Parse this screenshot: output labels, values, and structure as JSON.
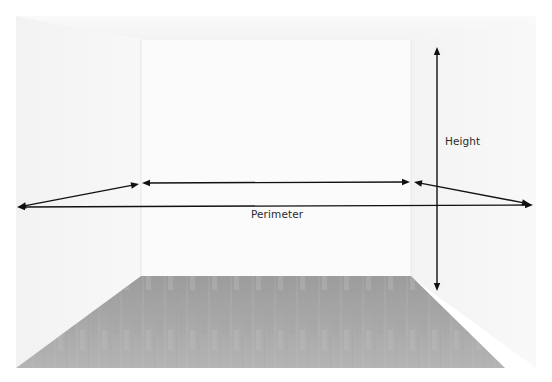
{
  "diagram": {
    "labels": {
      "height": "Height",
      "perimeter": "Perimeter"
    },
    "colors": {
      "arrow": "#111111",
      "wall": "#f4f4f4",
      "floor": "#a9a9a9",
      "text": "#2a2a2a"
    },
    "arrows": [
      {
        "name": "height-arrow",
        "meaning": "Height",
        "heads": "both"
      },
      {
        "name": "perimeter-front-arrow",
        "meaning": "Perimeter",
        "heads": "both"
      },
      {
        "name": "perimeter-left-wall-arrow",
        "meaning": "Perimeter",
        "heads": "both"
      },
      {
        "name": "perimeter-back-wall-arrow",
        "meaning": "Perimeter",
        "heads": "both"
      },
      {
        "name": "perimeter-right-wall-arrow",
        "meaning": "Perimeter",
        "heads": "both"
      }
    ]
  }
}
